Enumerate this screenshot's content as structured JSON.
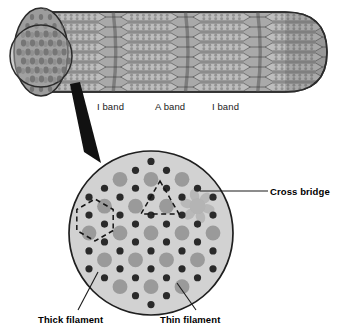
{
  "figure": {
    "background_color": "#ffffff"
  },
  "myofibril": {
    "name": "myofibril-cylinder",
    "body_color": "#a8a8a8",
    "light_band_color": "#bdbdbd",
    "dark_band_color": "#8f8f8f",
    "z_line_color": "#7a7a7a",
    "outline_color": "#2b2b2b",
    "end_face_color": "#9c9c9c",
    "inset_circle_color": "#a5a5a5",
    "band_labels": [
      {
        "id": "i-band-left",
        "text": "I band",
        "x": 97,
        "y": 101
      },
      {
        "id": "a-band",
        "text": "A band",
        "x": 155,
        "y": 101
      },
      {
        "id": "i-band-right",
        "text": "I band",
        "x": 212,
        "y": 101
      }
    ],
    "sarcomere_count": 4,
    "myofilament_rows": 8
  },
  "zoom_arrow": {
    "name": "magnification-arrow",
    "color": "#111111",
    "from": {
      "x": 74,
      "y": 86
    },
    "to": {
      "x": 96,
      "y": 160
    }
  },
  "cross_section": {
    "name": "cross-section-circle",
    "center": {
      "x": 151,
      "y": 233
    },
    "radius": 82,
    "fill_color": "#d2d2d2",
    "outline_color": "#1f1f1f",
    "thick_filament": {
      "label": "Thick filament",
      "color": "#9a9a9a",
      "radius": 7.4,
      "description": "myosin"
    },
    "thin_filament": {
      "label": "Thin filament",
      "color": "#2a2a2a",
      "radius": 3.6,
      "description": "actin"
    },
    "cross_bridge": {
      "label": "Cross bridge",
      "color": "#b4b4b4",
      "arms": 6,
      "center": {
        "x": 196,
        "y": 208
      }
    },
    "hexagon_annotation": {
      "name": "dashed-hexagon",
      "center": {
        "x": 95,
        "y": 220
      },
      "radius": 21,
      "dash_color": "#151515",
      "meaning": "six thin filaments surround one thick filament"
    },
    "triangle_annotation": {
      "name": "dashed-triangle",
      "center": {
        "x": 160,
        "y": 203
      },
      "radius": 22,
      "dash_color": "#151515",
      "meaning": "three thick filaments surround one thin filament"
    },
    "labels": [
      {
        "id": "cross-bridge",
        "text": "Cross bridge",
        "x": 270,
        "y": 186,
        "leader_from": {
          "x": 268,
          "y": 191
        },
        "leader_to": {
          "x": 200,
          "y": 191
        }
      },
      {
        "id": "thick-filament",
        "text": "Thick filament",
        "x": 38,
        "y": 314,
        "leader_from": {
          "x": 78,
          "y": 310
        },
        "leader_to": {
          "x": 98,
          "y": 272
        }
      },
      {
        "id": "thin-filament",
        "text": "Thin filament",
        "x": 160,
        "y": 314,
        "leader_from": {
          "x": 196,
          "y": 310
        },
        "leader_to": {
          "x": 177,
          "y": 283
        }
      }
    ]
  }
}
